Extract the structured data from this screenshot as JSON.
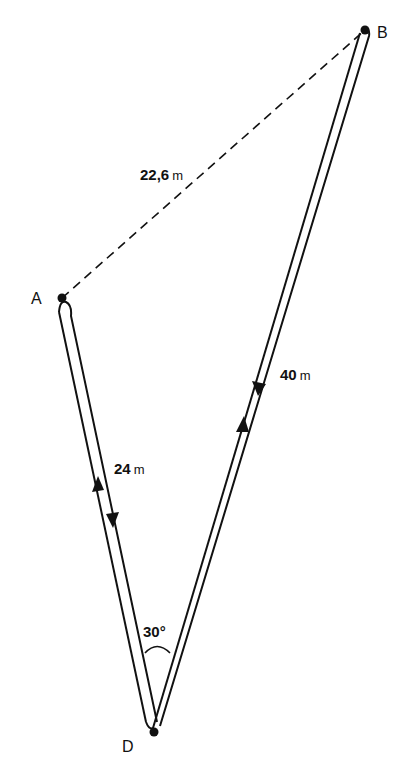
{
  "diagram": {
    "type": "path-displacement",
    "points": [
      {
        "id": "A",
        "label": "A"
      },
      {
        "id": "B",
        "label": "B"
      },
      {
        "id": "D",
        "label": "D"
      }
    ],
    "segments": [
      {
        "from": "A",
        "to": "D",
        "value": "24",
        "unit": "m",
        "style": "double-line round-trip"
      },
      {
        "from": "D",
        "to": "B",
        "value": "40",
        "unit": "m",
        "style": "double-line round-trip"
      },
      {
        "from": "A",
        "to": "B",
        "value": "22,6",
        "unit": "m",
        "style": "dashed"
      }
    ],
    "angle": {
      "at": "D",
      "label": "30°"
    },
    "colors": {
      "ink": "#111111",
      "background": "#ffffff"
    }
  }
}
